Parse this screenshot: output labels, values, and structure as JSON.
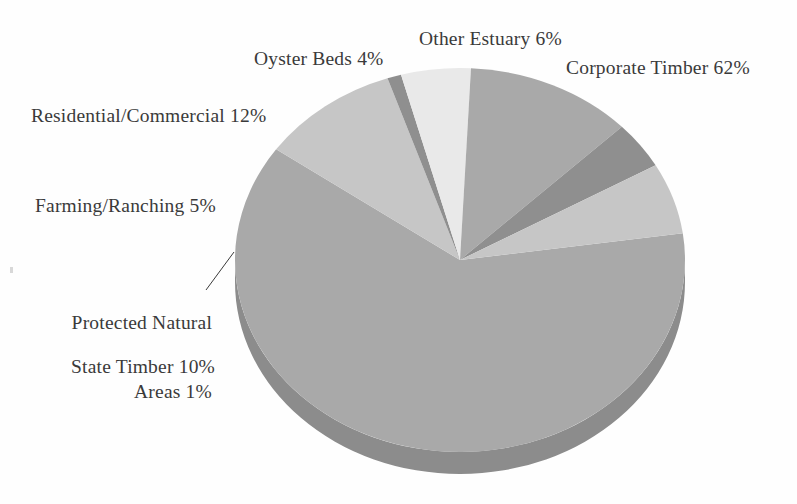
{
  "figure": {
    "background_color": "#fefefe",
    "text_color": "#3a3a3a"
  },
  "chart_data": {
    "type": "pie",
    "title": "",
    "subtitle": "",
    "xlabel": "",
    "ylabel": "",
    "legend_position": "none",
    "labels_position": "outside-with-leader",
    "style": "3d-pie-grayscale",
    "grid": false,
    "units": "percent",
    "total": 100,
    "categories": [
      "Corporate Timber",
      "State Timber",
      "Protected Natural Areas",
      "Farming/Ranching",
      "Residential/Commercial",
      "Oyster Beds",
      "Other Estuary"
    ],
    "values": [
      62,
      10,
      1,
      5,
      12,
      4,
      6
    ],
    "slices": [
      {
        "name": "Corporate Timber",
        "value": 62,
        "label": "Corporate Timber 62%",
        "color": "#a9a9a9",
        "side_color": "#8c8c8c",
        "start_angle_deg": -8,
        "end_angle_deg": 215.2
      },
      {
        "name": "State Timber",
        "value": 10,
        "label": "State Timber 10%",
        "color": "#c6c6c6",
        "side_color": "#a3a3a3",
        "start_angle_deg": 215.2,
        "end_angle_deg": 251.2
      },
      {
        "name": "Protected Natural Areas",
        "value": 1,
        "label": "Protected Natural\nAreas 1%",
        "color": "#8f8f8f",
        "side_color": "#7a7a7a",
        "start_angle_deg": 251.2,
        "end_angle_deg": 254.8
      },
      {
        "name": "Farming/Ranching",
        "value": 5,
        "label": "Farming/Ranching 5%",
        "color": "#e9e9e9",
        "side_color": "#c4c4c4",
        "start_angle_deg": 254.8,
        "end_angle_deg": 272.8
      },
      {
        "name": "Residential/Commercial",
        "value": 12,
        "label": "Residential/Commercial 12%",
        "color": "#a9a9a9",
        "side_color": "#8c8c8c",
        "start_angle_deg": 272.8,
        "end_angle_deg": 316
      },
      {
        "name": "Oyster Beds",
        "value": 4,
        "label": "Oyster Beds 4%",
        "color": "#8f8f8f",
        "side_color": "#7a7a7a",
        "start_angle_deg": 316,
        "end_angle_deg": 330.4
      },
      {
        "name": "Other Estuary",
        "value": 6,
        "label": "Other Estuary 6%",
        "color": "#c6c6c6",
        "side_color": "#a3a3a3",
        "start_angle_deg": 330.4,
        "end_angle_deg": 352
      }
    ],
    "geometry": {
      "center_x": 460,
      "center_y": 260,
      "radius_x": 225,
      "radius_y": 192,
      "depth": 22
    },
    "leader_lines": [
      {
        "for": "Protected Natural Areas",
        "x1": 206,
        "y1": 290,
        "x2": 234,
        "y2": 252
      }
    ]
  },
  "labels": {
    "corporate_timber": "Corporate Timber 62%",
    "other_estuary": "Other Estuary 6%",
    "oyster_beds": "Oyster Beds 4%",
    "residential_commercial": "Residential/Commercial 12%",
    "farming_ranching": "Farming/Ranching 5%",
    "protected_natural_areas_line1": "Protected Natural",
    "protected_natural_areas_line2": "Areas 1%",
    "state_timber": "State Timber 10%"
  }
}
